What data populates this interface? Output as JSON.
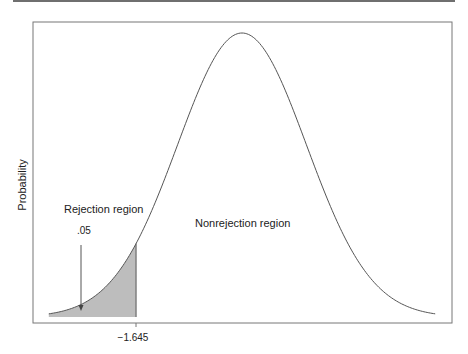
{
  "chart_data": {
    "type": "area",
    "title": "",
    "xlabel": "",
    "ylabel": "Probability",
    "distribution": "standard normal",
    "x_range": [
      -3,
      3
    ],
    "critical_value": -1.645,
    "x_ticks": [
      -1.645
    ],
    "x_tick_labels": [
      "−1.645"
    ],
    "shaded_region": {
      "from": -3,
      "to": -1.645,
      "area": 0.05,
      "label": ".05"
    },
    "annotations": [
      {
        "text": "Rejection region",
        "region": "left tail"
      },
      {
        "text": ".05",
        "type": "arrow-label",
        "points_to": "shaded tail"
      },
      {
        "text": "Nonrejection region",
        "region": "center/right"
      }
    ],
    "grid": false,
    "legend": null,
    "colors": {
      "curve": "#555555",
      "shade": "#bdbdbd",
      "frame": "#777777"
    }
  },
  "labels": {
    "ylabel": "Probability",
    "rejection": "Rejection region",
    "alpha": ".05",
    "nonrejection": "Nonrejection region",
    "tick": "−1.645"
  }
}
